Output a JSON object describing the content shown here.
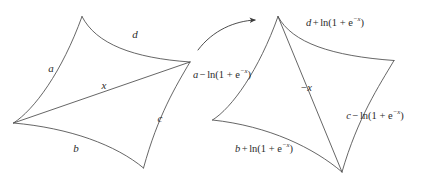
{
  "figure": {
    "type": "diagram",
    "background_color": "#ffffff",
    "stroke_color": "#4a4a4a",
    "text_color": "#2b2b2b"
  },
  "left_shape": {
    "name": "quadrilateral-before-flip",
    "edges": {
      "top_left": "a",
      "top_right": "d",
      "bottom_left": "b",
      "bottom_right": "c"
    },
    "diagonal": "x"
  },
  "right_shape": {
    "name": "quadrilateral-after-flip",
    "edges": {
      "top_left": "a − ln(1 + e^{−x})",
      "top_right": "d + ln(1 + e^{−x})",
      "bottom_left": "b + ln(1 + e^{−x})",
      "bottom_right": "c − ln(1 + e^{−x})"
    },
    "diagonal": "−x"
  },
  "labels": {
    "a": "a",
    "b": "b",
    "c": "c",
    "d": "d",
    "x": "x",
    "neg_x": "−x",
    "a_minus": {
      "var": "a",
      "op": "−",
      "fn": "ln",
      "arg_base": "1 + e",
      "arg_exp": "−x"
    },
    "d_plus": {
      "var": "d",
      "op": "+",
      "fn": "ln",
      "arg_base": "1 + e",
      "arg_exp": "−x"
    },
    "b_plus": {
      "var": "b",
      "op": "+",
      "fn": "ln",
      "arg_base": "1 + e",
      "arg_exp": "−x"
    },
    "c_minus": {
      "var": "c",
      "op": "−",
      "fn": "ln",
      "arg_base": "1 + e",
      "arg_exp": "−x"
    }
  },
  "arrow": {
    "name": "flip-arrow",
    "direction": "left-to-right"
  }
}
